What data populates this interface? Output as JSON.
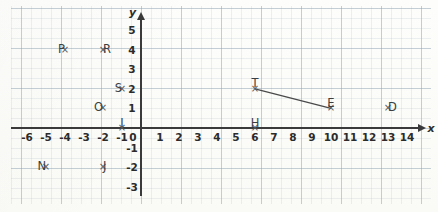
{
  "chart_data": {
    "type": "scatter",
    "title": "",
    "xlabel": "x",
    "ylabel": "y",
    "xlim": [
      -7,
      15
    ],
    "ylim": [
      -3.6,
      5.6
    ],
    "grid": true,
    "legend": "none",
    "x_ticks": [
      "-6",
      "-5",
      "-4",
      "-3",
      "-2",
      "-1",
      "0",
      "1",
      "2",
      "3",
      "4",
      "5",
      "6",
      "7",
      "8",
      "9",
      "10",
      "11",
      "12",
      "13",
      "14"
    ],
    "y_ticks": [
      "5",
      "4",
      "3",
      "2",
      "1",
      "-1",
      "-2",
      "-3"
    ],
    "points": [
      {
        "label": "P",
        "x": -4,
        "y": 4,
        "label_pos": "left"
      },
      {
        "label": "R",
        "x": -2,
        "y": 4,
        "label_pos": "right"
      },
      {
        "label": "S",
        "x": -1,
        "y": 2,
        "label_pos": "left"
      },
      {
        "label": "O",
        "x": -2,
        "y": 1,
        "label_pos": "left"
      },
      {
        "label": "I",
        "x": -1,
        "y": 0,
        "label_pos": "above"
      },
      {
        "label": "N",
        "x": -5,
        "y": -2,
        "label_pos": "left"
      },
      {
        "label": "J",
        "x": -2,
        "y": -2,
        "label_pos": "right"
      },
      {
        "label": "T",
        "x": 6,
        "y": 2,
        "label_pos": "above"
      },
      {
        "label": "E",
        "x": 10,
        "y": 1,
        "label_pos": "above"
      },
      {
        "label": "H",
        "x": 6,
        "y": 0,
        "label_pos": "above"
      },
      {
        "label": "D",
        "x": 13,
        "y": 1,
        "label_pos": "right"
      }
    ],
    "segments": [
      {
        "name": "TE",
        "from": "T",
        "to": "E",
        "x1": 6,
        "y1": 2,
        "x2": 10,
        "y2": 1
      }
    ],
    "colors": {
      "axis": "#3a3a3a",
      "grid_major": "#8ca0b2",
      "grid_minor": "#96a5b4",
      "point": "#55595c",
      "label": "#3b3f42",
      "segment": "#4a4a4a",
      "paper": "#fbfbf9"
    }
  },
  "axis_labels": {
    "x": "x",
    "y": "y"
  }
}
